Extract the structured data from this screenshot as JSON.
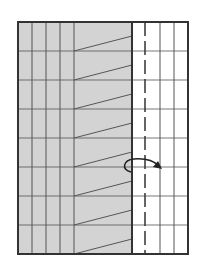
{
  "diagram": {
    "type": "folding-diagram",
    "width": 206,
    "height": 268,
    "sheet": {
      "x": 18,
      "y": 22,
      "w": 170,
      "h": 232
    },
    "colors": {
      "shaded": "#d3d3d3",
      "paper": "#ffffff",
      "line": "#555555",
      "border": "#333333",
      "arrow": "#222222"
    },
    "shaded_region": {
      "x": 18,
      "y": 22,
      "w": 114,
      "h": 232
    },
    "vertical_lines": [
      32,
      46,
      60,
      74,
      160,
      174
    ],
    "fold_edge_x": 132,
    "dashed_valley_x": 145,
    "horizontal_lines": [
      51,
      80,
      109,
      138,
      167,
      196,
      225
    ],
    "diagonal_offset": 15,
    "arrow": {
      "label": "fold-over arrow",
      "direction": "right"
    }
  }
}
